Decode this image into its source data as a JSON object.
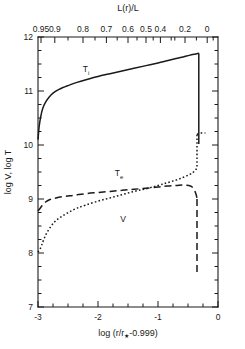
{
  "chart_data": {
    "type": "line",
    "title": "",
    "xlabel": "log (r/r★-0.999)",
    "ylabel": "log V, log T",
    "top_axis_label": "L(r)/L",
    "xlim": [
      -3,
      0
    ],
    "ylim": [
      7,
      12
    ],
    "x_ticks": [
      -3,
      -2,
      -1,
      0
    ],
    "x_tick_labels": [
      "-3",
      "-2",
      "-1",
      "0"
    ],
    "x_minor_step": 0.25,
    "y_ticks": [
      7,
      8,
      9,
      10,
      11,
      12
    ],
    "y_tick_labels": [
      "7",
      "8",
      "9",
      "10",
      "11",
      "12"
    ],
    "y_minor_step": 0.25,
    "grid": false,
    "legend": "inline-labels",
    "top_axis": {
      "label": "L(r)/L",
      "tick_labels": [
        "0.95",
        "0.9",
        "0.8",
        "0.7",
        "0.6",
        "0.5",
        "0.4",
        "0.2",
        "0"
      ],
      "tick_x_positions": [
        -2.95,
        -2.72,
        -2.25,
        -1.86,
        -1.5,
        -1.2,
        -0.96,
        -0.55,
        -0.18
      ],
      "minor_tick_x_positions": [
        -2.5,
        -2.05,
        -1.68,
        -1.35,
        -1.08,
        -0.78,
        -0.72,
        -0.36,
        -0.08
      ]
    },
    "series": [
      {
        "name": "T_i",
        "label": "T",
        "label_sub": "i",
        "style": "solid",
        "label_x": -2.2,
        "label_y": 11.35,
        "points": [
          [
            -3.0,
            10.1
          ],
          [
            -2.98,
            10.35
          ],
          [
            -2.95,
            10.55
          ],
          [
            -2.92,
            10.68
          ],
          [
            -2.88,
            10.78
          ],
          [
            -2.82,
            10.88
          ],
          [
            -2.75,
            10.96
          ],
          [
            -2.65,
            11.03
          ],
          [
            -2.5,
            11.1
          ],
          [
            -2.35,
            11.16
          ],
          [
            -2.2,
            11.21
          ],
          [
            -2.0,
            11.27
          ],
          [
            -1.8,
            11.32
          ],
          [
            -1.6,
            11.37
          ],
          [
            -1.4,
            11.42
          ],
          [
            -1.2,
            11.47
          ],
          [
            -1.0,
            11.52
          ],
          [
            -0.85,
            11.56
          ],
          [
            -0.7,
            11.6
          ],
          [
            -0.58,
            11.63
          ],
          [
            -0.48,
            11.66
          ],
          [
            -0.4,
            11.68
          ],
          [
            -0.35,
            11.69
          ],
          [
            -0.33,
            11.7
          ],
          [
            -0.32,
            11.7
          ]
        ],
        "drop": {
          "x": -0.32,
          "y_from": 11.7,
          "y_to": 10.02
        }
      },
      {
        "name": "T_e",
        "label": "T",
        "label_sub": "e",
        "style": "dashed",
        "label_x": -1.65,
        "label_y": 9.42,
        "points": [
          [
            -3.0,
            8.78
          ],
          [
            -2.97,
            8.82
          ],
          [
            -2.93,
            8.88
          ],
          [
            -2.88,
            8.94
          ],
          [
            -2.8,
            8.99
          ],
          [
            -2.7,
            9.02
          ],
          [
            -2.55,
            9.05
          ],
          [
            -2.4,
            9.07
          ],
          [
            -2.2,
            9.1
          ],
          [
            -2.0,
            9.12
          ],
          [
            -1.8,
            9.14
          ],
          [
            -1.6,
            9.16
          ],
          [
            -1.4,
            9.18
          ],
          [
            -1.2,
            9.2
          ],
          [
            -1.0,
            9.22
          ],
          [
            -0.85,
            9.24
          ],
          [
            -0.7,
            9.25
          ],
          [
            -0.6,
            9.26
          ],
          [
            -0.52,
            9.255
          ],
          [
            -0.46,
            9.24
          ],
          [
            -0.42,
            9.21
          ],
          [
            -0.39,
            9.16
          ],
          [
            -0.37,
            9.1
          ],
          [
            -0.355,
            9.04
          ],
          [
            -0.35,
            9.0
          ]
        ],
        "drop": {
          "x": -0.35,
          "y_from": 9.0,
          "y_to": 7.62
        }
      },
      {
        "name": "V",
        "label": "V",
        "label_sub": "",
        "style": "dotted",
        "label_x": -1.58,
        "label_y": 8.58,
        "points": [
          [
            -3.0,
            8.02
          ],
          [
            -2.97,
            8.06
          ],
          [
            -2.94,
            8.14
          ],
          [
            -2.9,
            8.26
          ],
          [
            -2.85,
            8.38
          ],
          [
            -2.78,
            8.5
          ],
          [
            -2.7,
            8.6
          ],
          [
            -2.6,
            8.68
          ],
          [
            -2.48,
            8.76
          ],
          [
            -2.35,
            8.83
          ],
          [
            -2.2,
            8.89
          ],
          [
            -2.0,
            8.96
          ],
          [
            -1.8,
            9.02
          ],
          [
            -1.6,
            9.08
          ],
          [
            -1.4,
            9.14
          ],
          [
            -1.2,
            9.19
          ],
          [
            -1.0,
            9.25
          ],
          [
            -0.85,
            9.3
          ],
          [
            -0.7,
            9.35
          ],
          [
            -0.58,
            9.4
          ],
          [
            -0.48,
            9.45
          ],
          [
            -0.42,
            9.49
          ],
          [
            -0.38,
            9.53
          ],
          [
            -0.355,
            9.57
          ],
          [
            -0.35,
            9.6
          ]
        ],
        "jump": {
          "x": -0.35,
          "y_from": 9.6,
          "y_to": 10.2
        },
        "tail": [
          [
            -0.35,
            10.2
          ],
          [
            -0.3,
            10.22
          ],
          [
            -0.25,
            10.22
          ],
          [
            -0.21,
            10.22
          ]
        ]
      }
    ]
  }
}
